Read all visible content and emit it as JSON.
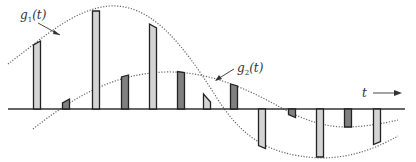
{
  "diagram": {
    "labels": {
      "g1": {
        "base": "g",
        "sub": "1",
        "arg": "(t)"
      },
      "g2": {
        "base": "g",
        "sub": "2",
        "arg": "(t)"
      },
      "time_axis": "t"
    },
    "colors": {
      "light_bar_fill": "#d4d4d4",
      "dark_bar_fill": "#808080",
      "bar_stroke": "#222222",
      "curve": "#666666",
      "axis": "#333333"
    },
    "baseline_y": 109,
    "samples_g1": [
      {
        "x": 37,
        "top": 43,
        "slope": -4
      },
      {
        "x": 96,
        "top": 11,
        "slope": 0
      },
      {
        "x": 153,
        "top": 26,
        "slope": 4
      },
      {
        "x": 207,
        "top": 98,
        "slope": 8
      },
      {
        "x": 262,
        "top": 147,
        "slope": 3
      },
      {
        "x": 320,
        "top": 157,
        "slope": 0
      },
      {
        "x": 377,
        "top": 143,
        "slope": -3
      }
    ],
    "samples_g2": [
      {
        "x": 66,
        "top": 101,
        "slope": -4
      },
      {
        "x": 125,
        "top": 76,
        "slope": -2
      },
      {
        "x": 181,
        "top": 72,
        "slope": 1
      },
      {
        "x": 234,
        "top": 85,
        "slope": 2
      },
      {
        "x": 292,
        "top": 116,
        "slope": 3
      },
      {
        "x": 348,
        "top": 127,
        "slope": 0
      }
    ]
  }
}
